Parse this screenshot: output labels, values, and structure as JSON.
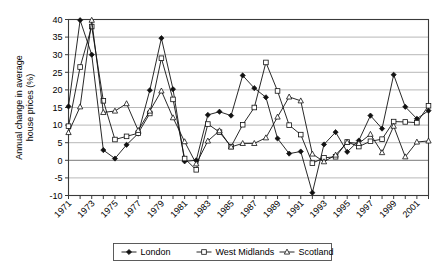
{
  "chart_data": {
    "type": "line",
    "title": "",
    "subtitle": "",
    "xlabel": "",
    "ylabel": "Annual change in average house prices (%)",
    "ylim": [
      -10,
      40
    ],
    "ytick_step": 5,
    "yticks": [
      -10,
      -5,
      0,
      5,
      10,
      15,
      20,
      25,
      30,
      35,
      40
    ],
    "ytick_labels": [
      "-10",
      "-5",
      "0",
      "5",
      "10",
      "15",
      "20",
      "25",
      "30",
      "35",
      "40"
    ],
    "grid": "horizontal",
    "legend_position": "bottom",
    "x": [
      1971,
      1972,
      1973,
      1974,
      1975,
      1976,
      1977,
      1978,
      1979,
      1980,
      1981,
      1982,
      1983,
      1984,
      1985,
      1986,
      1987,
      1988,
      1989,
      1990,
      1991,
      1992,
      1993,
      1994,
      1995,
      1996,
      1997,
      1998,
      1999,
      2000,
      2001,
      2002
    ],
    "xtick_labels": [
      "1971",
      "1973",
      "1975",
      "1977",
      "1979",
      "1981",
      "1983",
      "1985",
      "1987",
      "1989",
      "1991",
      "1993",
      "1995",
      "1997",
      "1999",
      "2001"
    ],
    "xtick_label_values": [
      1971,
      1973,
      1975,
      1977,
      1979,
      1981,
      1983,
      1985,
      1987,
      1989,
      1991,
      1993,
      1995,
      1997,
      1999,
      2001
    ],
    "series": [
      {
        "name": "London",
        "marker": "filled-diamond",
        "color": "#111111",
        "values": [
          15.3,
          39.8,
          30.0,
          2.9,
          0.5,
          4.4,
          7.6,
          19.9,
          34.7,
          20.2,
          -0.3,
          0.0,
          12.9,
          13.8,
          12.7,
          24.1,
          20.5,
          17.9,
          6.2,
          1.9,
          2.5,
          -9.2,
          4.5,
          8.0,
          2.4,
          5.6,
          12.7,
          9.0,
          24.3,
          15.2,
          11.8,
          14.1
        ]
      },
      {
        "name": "West Midlands",
        "marker": "open-square",
        "color": "#111111",
        "values": [
          9.7,
          26.5,
          38.0,
          16.9,
          5.9,
          6.8,
          7.7,
          13.3,
          29.0,
          17.3,
          0.5,
          -2.7,
          10.3,
          8.0,
          3.9,
          10.1,
          15.0,
          27.8,
          19.7,
          10.0,
          7.3,
          -0.8,
          0.7,
          1.0,
          5.2,
          3.9,
          5.4,
          6.0,
          11.0,
          10.9,
          10.7,
          15.5
        ]
      },
      {
        "name": "Scotland",
        "marker": "open-triangle",
        "color": "#111111",
        "values": [
          7.9,
          15.2,
          39.8,
          13.6,
          14.0,
          16.1,
          8.5,
          14.0,
          19.7,
          12.1,
          5.3,
          -1.0,
          5.5,
          8.4,
          3.8,
          4.8,
          4.8,
          6.4,
          12.3,
          18.0,
          16.9,
          1.8,
          -0.4,
          1.5,
          5.1,
          4.8,
          7.4,
          2.2,
          9.7,
          1.0,
          5.2,
          5.5
        ]
      }
    ]
  },
  "legend": {
    "items": [
      {
        "label": "London",
        "marker": "filled-diamond"
      },
      {
        "label": "West Midlands",
        "marker": "open-square"
      },
      {
        "label": "Scotland",
        "marker": "open-triangle"
      }
    ]
  }
}
